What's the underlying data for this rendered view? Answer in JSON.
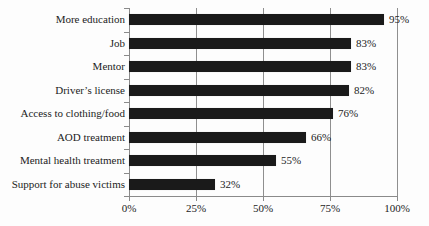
{
  "chart_data": {
    "type": "bar",
    "orientation": "horizontal",
    "title": "",
    "xlabel": "",
    "ylabel": "",
    "categories": [
      "More education",
      "Job",
      "Mentor",
      "Driver’s license",
      "Access to clothing/food",
      "AOD treatment",
      "Mental health treatment",
      "Support for abuse victims"
    ],
    "values": [
      95,
      83,
      83,
      82,
      76,
      66,
      55,
      32
    ],
    "value_labels": [
      "95%",
      "83%",
      "83%",
      "82%",
      "76%",
      "66%",
      "55%",
      "32%"
    ],
    "x_tick_labels": [
      "0%",
      "25%",
      "50%",
      "75%",
      "100%"
    ],
    "x_tick_values": [
      0,
      25,
      50,
      75,
      100
    ],
    "xlim": [
      0,
      100
    ],
    "grid": "vertical-gridlines-25pct",
    "legend": "none",
    "colors": {
      "bar": "#1a1a1a",
      "axis": "#8a8a8a",
      "grid": "#8f8f8f",
      "text": "#1c1c1c",
      "background": "#fdfdfd"
    }
  }
}
